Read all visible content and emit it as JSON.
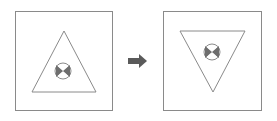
{
  "diagram": {
    "colors": {
      "frame": "#8a8a8a",
      "triangle": "#8a8a8a",
      "symbol_fill": "#6e6e6e",
      "arrow": "#5a5a5a",
      "background": "#ffffff"
    },
    "panels": [
      {
        "name": "before",
        "triangle": "upright",
        "symbol_position": "lower-center"
      },
      {
        "name": "after",
        "triangle": "inverted",
        "symbol_position": "upper-center"
      }
    ],
    "arrow_icon": "right-arrow-icon"
  }
}
